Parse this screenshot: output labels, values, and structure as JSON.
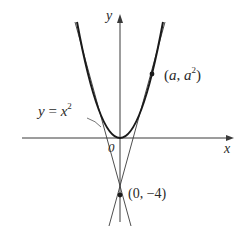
{
  "figure": {
    "curve_label": {
      "lhs": "y",
      "eq": " = ",
      "rhs": "x",
      "exp": "2"
    },
    "axis_x_label": "x",
    "axis_y_label": "y",
    "origin_label": "0",
    "tangent_point_label": {
      "open": "(",
      "a": "a",
      "sep": ", ",
      "a2": "a",
      "exp": "2",
      "close": ")"
    },
    "external_point_label": "(0, −4)",
    "colors": {
      "curve": "#1a1a1a",
      "axes": "#3a3a3a",
      "tangents": "#3a3a3a",
      "text": "#2a2a2a"
    }
  }
}
